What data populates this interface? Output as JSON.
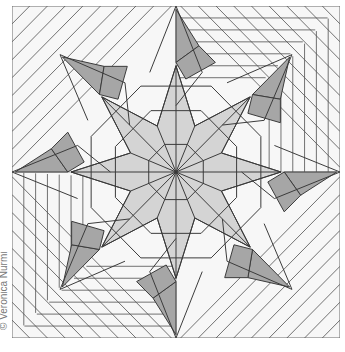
{
  "diagram": {
    "type": "origami crease pattern",
    "credit": "© Veronica Nurmi",
    "colors": {
      "background": "#ffffff",
      "paper": "#f7f7f7",
      "line": "#3a3a3a",
      "dark_fill": "#a6a6a6",
      "light_fill": "#d4d4d4",
      "pleat_line": "#555555"
    }
  }
}
